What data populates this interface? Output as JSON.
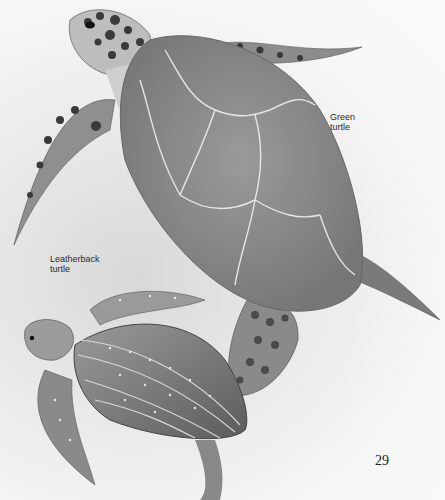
{
  "labels": {
    "green_turtle": [
      "Green",
      "turtle"
    ],
    "leatherback_turtle": [
      "Leatherback",
      "turtle"
    ]
  },
  "page_number": "29",
  "colors": {
    "background": "#f3f3f3",
    "shell": "#8a8a8a",
    "shell_dark": "#6e6e6e",
    "scale_dark": "#3a3a3a",
    "text": "#2a2a2a"
  }
}
